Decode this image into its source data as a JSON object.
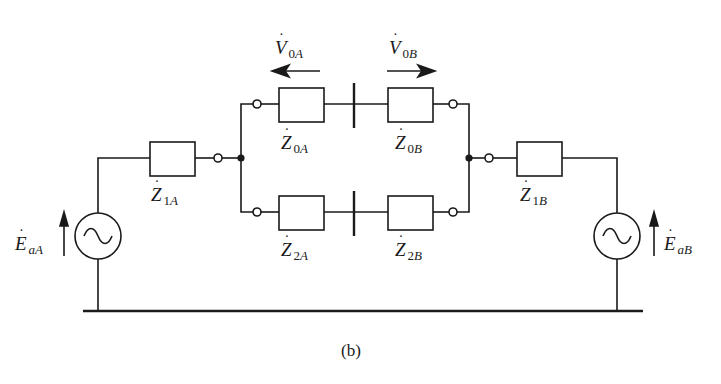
{
  "diagram": {
    "caption": "(b)",
    "stroke_color": "#1a1a1a",
    "labels": {
      "V0A": {
        "base": "V",
        "dot": "˙",
        "sub_num": "0",
        "sub_letter": "A"
      },
      "V0B": {
        "base": "V",
        "dot": "˙",
        "sub_num": "0",
        "sub_letter": "B"
      },
      "Z0A": {
        "base": "Z",
        "dot": "˙",
        "sub_num": "0",
        "sub_letter": "A"
      },
      "Z0B": {
        "base": "Z",
        "dot": "˙",
        "sub_num": "0",
        "sub_letter": "B"
      },
      "Z1A": {
        "base": "Z",
        "dot": "˙",
        "sub_num": "1",
        "sub_letter": "A"
      },
      "Z1B": {
        "base": "Z",
        "dot": "˙",
        "sub_num": "1",
        "sub_letter": "B"
      },
      "Z2A": {
        "base": "Z",
        "dot": "˙",
        "sub_num": "2",
        "sub_letter": "A"
      },
      "Z2B": {
        "base": "Z",
        "dot": "˙",
        "sub_num": "2",
        "sub_letter": "B"
      },
      "EaA": {
        "base": "E",
        "dot": "˙",
        "sub_num": "",
        "sub_letter": "aA"
      },
      "EaB": {
        "base": "E",
        "dot": "˙",
        "sub_num": "",
        "sub_letter": "aB"
      }
    },
    "components": [
      {
        "id": "source-A",
        "type": "ac-voltage-source",
        "label": "EaA"
      },
      {
        "id": "Z1A",
        "type": "impedance",
        "label": "Z1A"
      },
      {
        "id": "Z0A",
        "type": "impedance",
        "label": "Z0A",
        "branch": "zero-sequence"
      },
      {
        "id": "Z0B",
        "type": "impedance",
        "label": "Z0B",
        "branch": "zero-sequence"
      },
      {
        "id": "Z2A",
        "type": "impedance",
        "label": "Z2A",
        "branch": "negative-sequence"
      },
      {
        "id": "Z2B",
        "type": "impedance",
        "label": "Z2B",
        "branch": "negative-sequence"
      },
      {
        "id": "Z1B",
        "type": "impedance",
        "label": "Z1B"
      },
      {
        "id": "source-B",
        "type": "ac-voltage-source",
        "label": "EaB"
      }
    ],
    "voltage_arrows": [
      {
        "label": "V0A",
        "direction": "left"
      },
      {
        "label": "V0B",
        "direction": "right"
      }
    ]
  }
}
